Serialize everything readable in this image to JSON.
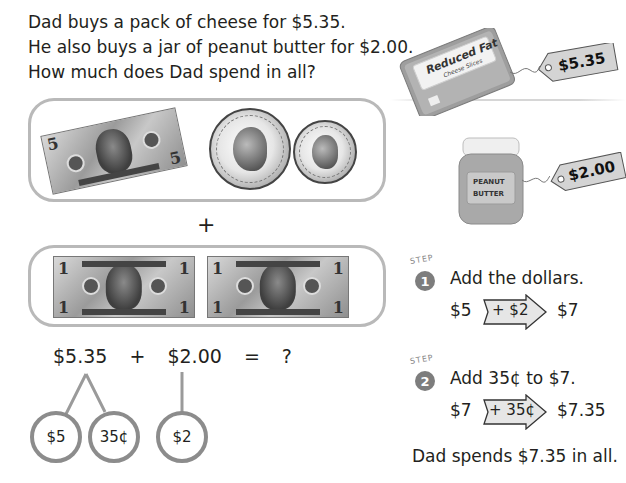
{
  "problem": {
    "lines": [
      "Dad buys a pack of cheese for $5.35.",
      "He also buys a jar of peanut butter for $2.00.",
      "How much does Dad spend in all?"
    ]
  },
  "products": {
    "cheese": {
      "label_line1": "Reduced Fat",
      "label_line2": "Cheese Slices",
      "price_tag": "$5.35"
    },
    "peanut_butter": {
      "label_line1": "PEANUT",
      "label_line2": "BUTTER",
      "price_tag": "$2.00"
    }
  },
  "money_groups": {
    "group1": {
      "items": [
        {
          "type": "bill",
          "denomination": "5",
          "name": "five-dollar bill"
        },
        {
          "type": "coin",
          "name": "quarter"
        },
        {
          "type": "coin",
          "name": "dime"
        }
      ]
    },
    "plus": "+",
    "group2": {
      "items": [
        {
          "type": "bill",
          "denomination": "1",
          "name": "one-dollar bill"
        },
        {
          "type": "bill",
          "denomination": "1",
          "name": "one-dollar bill"
        }
      ]
    }
  },
  "equation": {
    "left": "$5.35",
    "op": "+",
    "right": "$2.00",
    "eq": "=",
    "result": "?"
  },
  "number_bonds": [
    {
      "label": "$5"
    },
    {
      "label": "35¢"
    },
    {
      "label": "$2"
    }
  ],
  "steps": [
    {
      "step_word": "STEP",
      "number": "1",
      "instruction": "Add the dollars.",
      "start": "$5",
      "arrow_label": "+ $2",
      "end": "$7"
    },
    {
      "step_word": "STEP",
      "number": "2",
      "instruction": "Add 35¢ to $7.",
      "start": "$7",
      "arrow_label": "+ 35¢",
      "end": "$7.35"
    }
  ],
  "conclusion": "Dad spends $7.35 in all.",
  "colors": {
    "text": "#231f20",
    "box_border": "#b9b9b9",
    "bond_border": "#8c8c8c",
    "step_badge": "#7d7d7d",
    "tag_fill": "#d4d4d4"
  }
}
